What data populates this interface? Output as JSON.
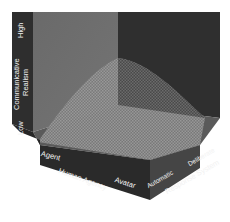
{
  "figure": {
    "title": "",
    "axes": {
      "vertical": {
        "name": "Communicative Realism",
        "line1": "Communicative",
        "line2": "Realism",
        "low": "Low",
        "high": "High"
      },
      "front_left": {
        "name": "Human Agency",
        "start": "Agent",
        "end": "Avatar"
      },
      "front_right": {
        "name": "Response System",
        "start": "Automatic",
        "end": "Deliberate"
      }
    },
    "colors": {
      "left_strip": "#2e2e2e",
      "back_left_wall": "#6e6e6e",
      "back_right_wall": "#2f2f2f",
      "floor": "#5a5a5a",
      "front_left_face": "#2a2a2a",
      "front_right_face": "#4a4a4a",
      "surface": "#8a8a8a",
      "label": "#f2f2f2"
    }
  }
}
